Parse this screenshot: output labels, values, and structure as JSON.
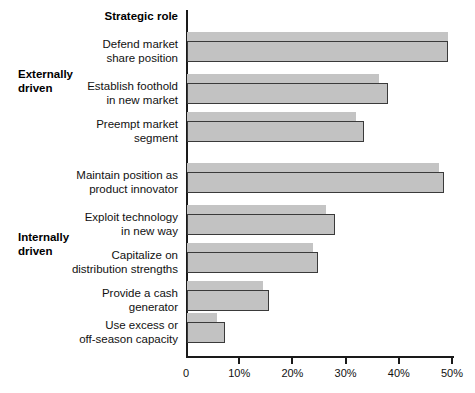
{
  "header": {
    "title": "Strategic role"
  },
  "sections": [
    {
      "id": "externally-driven",
      "label_line1": "Externally",
      "label_line2": "driven"
    },
    {
      "id": "internally-driven",
      "label_line1": "Internally",
      "label_line2": "driven"
    }
  ],
  "axis": {
    "ticks": [
      "0",
      "10%",
      "20%",
      "30%",
      "40%",
      "50%"
    ]
  },
  "chart_data": {
    "type": "bar",
    "orientation": "horizontal",
    "title": "Strategic role",
    "xlabel": "",
    "ylabel": "",
    "xlim": [
      0,
      50
    ],
    "xtick_values": [
      0,
      10,
      20,
      30,
      40,
      50
    ],
    "xtick_labels": [
      "0",
      "10%",
      "20%",
      "30%",
      "40%",
      "50%"
    ],
    "grid": false,
    "legend": "none",
    "categories": [
      "Defend market share position",
      "Establish foothold in new market",
      "Preempt market segment",
      "Maintain position as product innovator",
      "Exploit technology in new way",
      "Capitalize on distribution strengths",
      "Provide a cash generator",
      "Use excess or off-season capacity"
    ],
    "category_lines": [
      [
        "Defend market",
        "share position"
      ],
      [
        "Establish foothold",
        "in new market"
      ],
      [
        "Preempt market",
        "segment"
      ],
      [
        "Maintain position as",
        "product innovator"
      ],
      [
        "Exploit technology",
        "in new way"
      ],
      [
        "Capitalize on",
        "distribution strengths"
      ],
      [
        "Provide a cash",
        "generator"
      ],
      [
        "Use excess or",
        "off-season capacity"
      ]
    ],
    "category_groups": [
      "Externally driven",
      "Externally driven",
      "Externally driven",
      "Internally driven",
      "Internally driven",
      "Internally driven",
      "Internally driven",
      "Internally driven"
    ],
    "series": [
      {
        "name": "upper",
        "values": [
          49.0,
          36.0,
          31.8,
          47.4,
          26.1,
          23.7,
          14.3,
          5.6
        ]
      },
      {
        "name": "lower",
        "values": [
          49.0,
          37.8,
          33.3,
          48.3,
          27.8,
          24.6,
          15.4,
          7.1
        ]
      }
    ],
    "colors": {
      "upper_fill": "#c4c4c4",
      "lower_fill": "#c2c2c2",
      "lower_border": "#3a3a3a",
      "axis": "#1a1a1a"
    }
  }
}
